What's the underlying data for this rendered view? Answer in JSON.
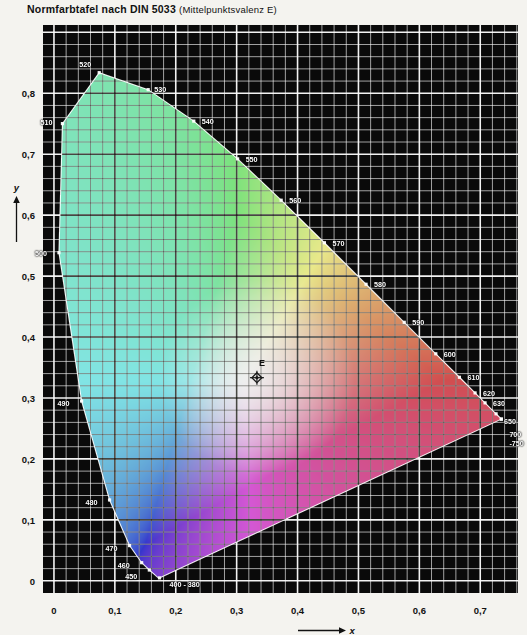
{
  "title": {
    "main": "Normfarbtafel nach DIN 5033",
    "sub": "(Mittelpunktsvalenz E)"
  },
  "axes": {
    "x_name": "x",
    "y_name": "y",
    "x_ticks": [
      "0",
      "0,1",
      "0,2",
      "0,3",
      "0,4",
      "0,5",
      "0,6",
      "0,7"
    ],
    "y_ticks": [
      "0",
      "0,1",
      "0,2",
      "0,3",
      "0,4",
      "0,5",
      "0,6",
      "0,7",
      "0,8"
    ],
    "x_range": [
      -0.018,
      0.762
    ],
    "y_range": [
      -0.02,
      0.912
    ],
    "grid_minor_step": 0.02,
    "grid_major_step": 0.1
  },
  "white_point": {
    "label": "E",
    "x": 0.3333,
    "y": 0.3333,
    "marker": "crosshair-diamond"
  },
  "colors": {
    "background": "#f4f3ef",
    "plot_background": "#0a0a0a",
    "grid_major": "#ffffff",
    "grid_minor": "#8f8f8f",
    "text": "#111111",
    "green": "#6cbc5e",
    "cyan": "#4f939c",
    "violet": "#6a5a96",
    "orange": "#c85a38",
    "yellow": "#d8d05a",
    "center_white": "#efeae4"
  },
  "chart_data": {
    "type": "scatter",
    "title": "Normfarbtafel nach DIN 5033 (Mittelpunktsvalenz E)",
    "xlabel": "x",
    "ylabel": "y",
    "xlim": [
      -0.018,
      0.762
    ],
    "ylim": [
      -0.02,
      0.912
    ],
    "grid": true,
    "legend": "none",
    "annotations": [
      {
        "label": "E",
        "x": 0.3333,
        "y": 0.3333,
        "note": "Mittelpunktsvalenz / equal-energy white point"
      }
    ],
    "spectral_locus": [
      {
        "nm": 380,
        "x": 0.1741,
        "y": 0.005
      },
      {
        "nm": 390,
        "x": 0.1738,
        "y": 0.0049
      },
      {
        "nm": 400,
        "x": 0.1733,
        "y": 0.0048
      },
      {
        "nm": 410,
        "x": 0.1726,
        "y": 0.0048
      },
      {
        "nm": 420,
        "x": 0.1714,
        "y": 0.0051
      },
      {
        "nm": 430,
        "x": 0.1689,
        "y": 0.0069
      },
      {
        "nm": 440,
        "x": 0.1644,
        "y": 0.0109
      },
      {
        "nm": 450,
        "x": 0.1566,
        "y": 0.0177
      },
      {
        "nm": 460,
        "x": 0.144,
        "y": 0.0297
      },
      {
        "nm": 470,
        "x": 0.1241,
        "y": 0.0578
      },
      {
        "nm": 480,
        "x": 0.0913,
        "y": 0.1327
      },
      {
        "nm": 490,
        "x": 0.0454,
        "y": 0.295
      },
      {
        "nm": 500,
        "x": 0.0082,
        "y": 0.5384
      },
      {
        "nm": 510,
        "x": 0.0139,
        "y": 0.7502
      },
      {
        "nm": 520,
        "x": 0.0743,
        "y": 0.8338
      },
      {
        "nm": 530,
        "x": 0.1547,
        "y": 0.8059
      },
      {
        "nm": 540,
        "x": 0.2296,
        "y": 0.7543
      },
      {
        "nm": 550,
        "x": 0.3016,
        "y": 0.6923
      },
      {
        "nm": 560,
        "x": 0.3731,
        "y": 0.6245
      },
      {
        "nm": 570,
        "x": 0.4441,
        "y": 0.5547
      },
      {
        "nm": 580,
        "x": 0.5125,
        "y": 0.4866
      },
      {
        "nm": 590,
        "x": 0.5752,
        "y": 0.4242
      },
      {
        "nm": 600,
        "x": 0.627,
        "y": 0.3725
      },
      {
        "nm": 610,
        "x": 0.6658,
        "y": 0.334
      },
      {
        "nm": 620,
        "x": 0.6915,
        "y": 0.3083
      },
      {
        "nm": 630,
        "x": 0.7079,
        "y": 0.292
      },
      {
        "nm": 640,
        "x": 0.719,
        "y": 0.2809
      },
      {
        "nm": 650,
        "x": 0.726,
        "y": 0.274
      },
      {
        "nm": 660,
        "x": 0.73,
        "y": 0.27
      },
      {
        "nm": 670,
        "x": 0.732,
        "y": 0.268
      },
      {
        "nm": 680,
        "x": 0.7334,
        "y": 0.2666
      },
      {
        "nm": 700,
        "x": 0.7347,
        "y": 0.2653
      },
      {
        "nm": 750,
        "x": 0.7347,
        "y": 0.2653
      }
    ],
    "wavelength_labels": [
      {
        "text": "520",
        "nm": 520,
        "dx": -20,
        "dy": -9
      },
      {
        "text": "530",
        "nm": 530,
        "dx": 6,
        "dy": -1
      },
      {
        "text": "540",
        "nm": 540,
        "dx": 8,
        "dy": 0
      },
      {
        "text": "550",
        "nm": 550,
        "dx": 8,
        "dy": 0
      },
      {
        "text": "560",
        "nm": 560,
        "dx": 8,
        "dy": 0
      },
      {
        "text": "570",
        "nm": 570,
        "dx": 8,
        "dy": 0
      },
      {
        "text": "580",
        "nm": 580,
        "dx": 8,
        "dy": 0
      },
      {
        "text": "590",
        "nm": 590,
        "dx": 8,
        "dy": 0
      },
      {
        "text": "600",
        "nm": 600,
        "dx": 8,
        "dy": 0
      },
      {
        "text": "610",
        "nm": 610,
        "dx": 8,
        "dy": 0
      },
      {
        "text": "620",
        "nm": 620,
        "dx": 8,
        "dy": 0
      },
      {
        "text": "630",
        "nm": 630,
        "dx": 8,
        "dy": 0
      },
      {
        "text": "650",
        "nm": 650,
        "dx": 8,
        "dy": 7
      },
      {
        "text": "700",
        "nm": 700,
        "dx": 8,
        "dy": 15
      },
      {
        "text": "-750",
        "nm": 750,
        "dx": 8,
        "dy": 24
      },
      {
        "text": "510",
        "nm": 510,
        "dx": -22,
        "dy": -2
      },
      {
        "text": "500",
        "nm": 500,
        "dx": -24,
        "dy": 0
      },
      {
        "text": "490",
        "nm": 490,
        "dx": -24,
        "dy": 2
      },
      {
        "text": "480",
        "nm": 480,
        "dx": -24,
        "dy": 2
      },
      {
        "text": "470",
        "nm": 470,
        "dx": -24,
        "dy": 2
      },
      {
        "text": "460",
        "nm": 460,
        "dx": -24,
        "dy": 2
      },
      {
        "text": "450",
        "nm": 450,
        "dx": -24,
        "dy": 6
      },
      {
        "text": "400 - 380",
        "nm": 400,
        "dx": 10,
        "dy": 6
      }
    ]
  }
}
